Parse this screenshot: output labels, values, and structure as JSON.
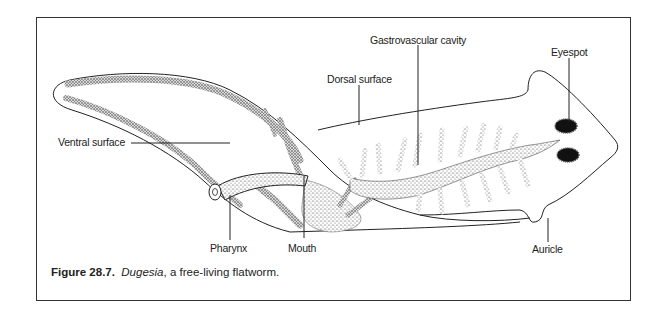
{
  "figure": {
    "caption_number": "Figure 28.7.",
    "caption_genus": "Dugesia",
    "caption_rest": ", a free-living flatworm.",
    "labels": {
      "gastrovascular_cavity": "Gastrovascular cavity",
      "eyespot": "Eyespot",
      "dorsal_surface": "Dorsal surface",
      "ventral_surface": "Ventral surface",
      "pharynx": "Pharynx",
      "mouth": "Mouth",
      "auricle": "Auricle"
    }
  }
}
